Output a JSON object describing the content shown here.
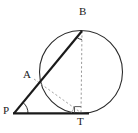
{
  "figure": {
    "background_color": "#ffffff",
    "stroke_color": "#1a1a1a",
    "dashed_color": "#8a8a8a",
    "circle_color": "#2b2b2b",
    "width": 138,
    "height": 133
  },
  "labels": {
    "p": "P",
    "a": "A",
    "b": "B",
    "t": "T"
  },
  "points": {
    "P": {
      "name": "P",
      "x": 15,
      "y": 113
    },
    "A": {
      "name": "A",
      "x": 34,
      "y": 79
    },
    "B": {
      "name": "B",
      "x": 82,
      "y": 31
    },
    "T": {
      "name": "T",
      "x": 81,
      "y": 113
    }
  },
  "circle": {
    "center_x": 81,
    "center_y": 72,
    "radius": 41.5
  },
  "segments": [
    {
      "name": "PT-tangent-line",
      "from": "P",
      "to": "T",
      "style": "solid-thick"
    },
    {
      "name": "PB-secant-line",
      "from": "P",
      "to": "B",
      "style": "solid-thick"
    },
    {
      "name": "BT-chord-dashed",
      "from": "B",
      "to": "T",
      "style": "dashed"
    },
    {
      "name": "AT-chord-dashed",
      "from": "A",
      "to": "T",
      "style": "dashed"
    }
  ],
  "angle_marks": [
    {
      "name": "angle-at-P",
      "vertex": "P",
      "type": "arc"
    },
    {
      "name": "angle-at-B",
      "vertex": "B",
      "type": "arc"
    },
    {
      "name": "angle-at-T",
      "vertex": "T",
      "type": "right-angle"
    }
  ]
}
